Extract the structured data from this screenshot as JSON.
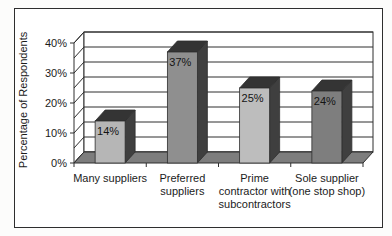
{
  "figure": {
    "kind": "scanned 3D column chart figure",
    "border_color": "#2e2e2e",
    "background": "#ffffff"
  },
  "chart_data": {
    "type": "bar",
    "title": "",
    "xlabel": "",
    "ylabel": "Percentage of Respondents",
    "categories": [
      "Many suppliers",
      "Preferred\nsuppliers",
      "Prime\ncontractor with\nsubcontractors",
      "Sole supplier\n(one stop shop)"
    ],
    "values": [
      14,
      37,
      25,
      24
    ],
    "data_labels": [
      "14%",
      "37%",
      "25%",
      "24%"
    ],
    "ytick_labels": [
      "0%",
      "10%",
      "20%",
      "30%",
      "40%"
    ],
    "ylim": [
      0,
      40
    ],
    "grid": true,
    "grid_interval": 5,
    "legend": "none",
    "style": "3d-column-grayscale",
    "bar_colors": [
      "#b6b6b6",
      "#8f8f8f",
      "#bdbdbd",
      "#7e7e7e"
    ],
    "bar_top_color": "#343434",
    "bar_side_color": "#3f3f3f",
    "floor_color": "#7d7d7d",
    "wall_color": "#ffffff",
    "line_color": "#2e2e2e",
    "text_color": "#1b1b1b"
  }
}
